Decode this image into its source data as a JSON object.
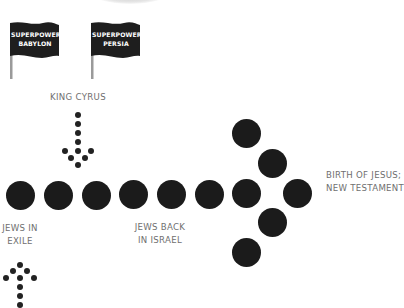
{
  "flags": [
    {
      "line1": "SUPERPOWER:",
      "line2": "BABYLON"
    },
    {
      "line1": "SUPERPOWER:",
      "line2": "PERSIA"
    }
  ],
  "labels": {
    "king_cyrus": "KING CYRUS",
    "exile_line1": "JEWS IN",
    "exile_line2": "EXILE",
    "back_line1": "JEWS BACK",
    "back_line2": "IN ISRAEL",
    "jesus_line1": "BIRTH OF JESUS;",
    "jesus_line2": "NEW TESTAMENT"
  },
  "colors": {
    "dot": "#1b1b1b",
    "label_text": "#6f6f6f",
    "flag": "#1e1e1e"
  }
}
